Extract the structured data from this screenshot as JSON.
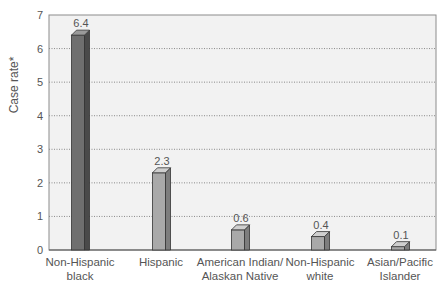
{
  "chart_data": {
    "type": "bar",
    "title": "",
    "xlabel": "",
    "ylabel": "Case rate*",
    "ylim": [
      0,
      7
    ],
    "yticks": [
      0,
      1,
      2,
      3,
      4,
      5,
      6,
      7
    ],
    "grid": "horizontal dotted",
    "categories": [
      "Non-Hispanic black",
      "Hispanic",
      "American Indian/ Alaskan Native",
      "Non-Hispanic white",
      "Asian/Pacific Islander"
    ],
    "category_lines": [
      [
        "Non-Hispanic",
        "black"
      ],
      [
        "Hispanic"
      ],
      [
        "American Indian/",
        "Alaskan Native"
      ],
      [
        "Non-Hispanic",
        "white"
      ],
      [
        "Asian/Pacific",
        "Islander"
      ]
    ],
    "values": [
      6.4,
      2.3,
      0.6,
      0.4,
      0.1
    ],
    "data_labels": [
      "6.4",
      "2.3",
      "0.6",
      "0.4",
      "0.1"
    ],
    "colors": {
      "highlight_bar": "#6f6f6f",
      "bar": "#a9a9a9",
      "plot_bg": "#f2f2f2",
      "grid": "#8a8a8a",
      "text": "#555555"
    }
  }
}
